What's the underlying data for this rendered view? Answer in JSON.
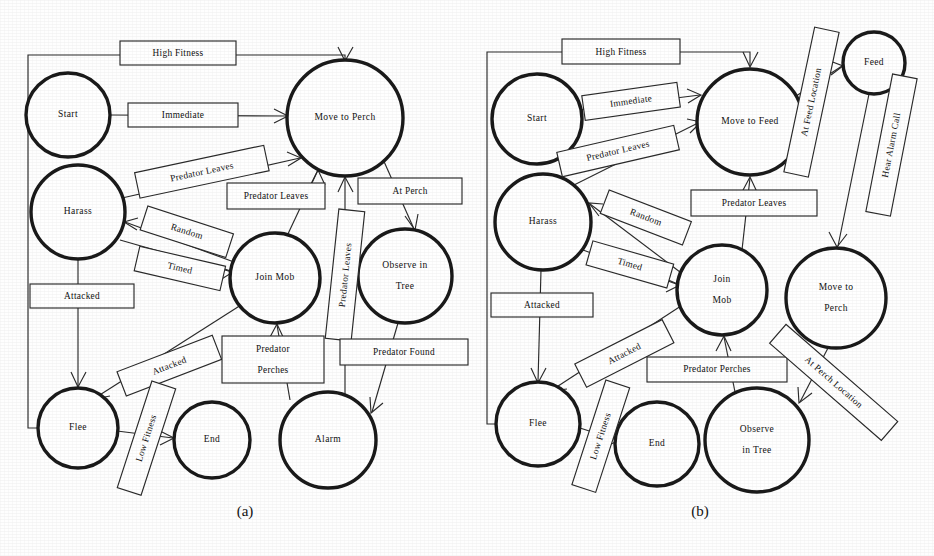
{
  "figure": {
    "panels": [
      {
        "id": "a",
        "caption": "(a)",
        "caption_x": 245,
        "caption_y": 516,
        "states": [
          {
            "name": "start",
            "label": "Start",
            "lines": [
              "Start"
            ],
            "cx": 68,
            "cy": 115,
            "r": 42
          },
          {
            "name": "harass",
            "label": "Harass",
            "lines": [
              "Harass"
            ],
            "cx": 78,
            "cy": 212,
            "r": 47
          },
          {
            "name": "move-to-perch",
            "label": "Move to Perch",
            "lines": [
              "Move to Perch"
            ],
            "cx": 345,
            "cy": 118,
            "r": 58
          },
          {
            "name": "join-mob",
            "label": "Join Mob",
            "lines": [
              "Join Mob"
            ],
            "cx": 275,
            "cy": 278,
            "r": 45
          },
          {
            "name": "observe-in-tree",
            "label": "Observe in Tree",
            "lines": [
              "Observe in",
              "Tree"
            ],
            "cx": 405,
            "cy": 276,
            "r": 47
          },
          {
            "name": "flee",
            "label": "Flee",
            "lines": [
              "Flee"
            ],
            "cx": 78,
            "cy": 428,
            "r": 40
          },
          {
            "name": "end",
            "label": "End",
            "lines": [
              "End"
            ],
            "cx": 212,
            "cy": 440,
            "r": 38
          },
          {
            "name": "alarm",
            "label": "Alarm",
            "lines": [
              "Alarm"
            ],
            "cx": 328,
            "cy": 440,
            "r": 48
          }
        ],
        "transitions": [
          {
            "name": "high-fitness",
            "label": "High Fitness",
            "from": "flee",
            "to": "move-to-perch"
          },
          {
            "name": "immediate",
            "label": "Immediate",
            "from": "start",
            "to": "move-to-perch"
          },
          {
            "name": "predator-leaves-1",
            "label": "Predator Leaves",
            "from": "harass",
            "to": "move-to-perch"
          },
          {
            "name": "predator-leaves-2",
            "label": "Predator Leaves",
            "from": "join-mob",
            "to": "move-to-perch"
          },
          {
            "name": "predator-leaves-3",
            "label": "Predator Leaves",
            "from": "alarm",
            "to": "move-to-perch"
          },
          {
            "name": "at-perch",
            "label": "At Perch",
            "from": "move-to-perch",
            "to": "observe-in-tree"
          },
          {
            "name": "random",
            "label": "Random",
            "from": "join-mob",
            "to": "harass"
          },
          {
            "name": "timed",
            "label": "Timed",
            "from": "harass",
            "to": "join-mob"
          },
          {
            "name": "attacked-1",
            "label": "Attacked",
            "from": "harass",
            "to": "flee"
          },
          {
            "name": "attacked-2",
            "label": "Attacked",
            "from": "join-mob",
            "to": "flee"
          },
          {
            "name": "low-fitness",
            "label": "Low Fitness",
            "from": "flee",
            "to": "end"
          },
          {
            "name": "predator-perches",
            "label": "Predator Perches",
            "from": "alarm",
            "to": "join-mob"
          },
          {
            "name": "predator-found",
            "label": "Predator Found",
            "from": "observe-in-tree",
            "to": "alarm"
          }
        ]
      },
      {
        "id": "b",
        "caption": "(b)",
        "caption_x": 700,
        "caption_y": 516,
        "states": [
          {
            "name": "start",
            "label": "Start",
            "lines": [
              "Start"
            ],
            "cx": 537,
            "cy": 119,
            "r": 45
          },
          {
            "name": "harass",
            "label": "Harass",
            "lines": [
              "Harass"
            ],
            "cx": 543,
            "cy": 222,
            "r": 48
          },
          {
            "name": "move-to-feed",
            "label": "Move to Feed",
            "lines": [
              "Move to Feed"
            ],
            "cx": 750,
            "cy": 122,
            "r": 53
          },
          {
            "name": "feed",
            "label": "Feed",
            "lines": [
              "Feed"
            ],
            "cx": 874,
            "cy": 63,
            "r": 31
          },
          {
            "name": "join-mob",
            "label": "Join Mob",
            "lines": [
              "Join",
              "Mob"
            ],
            "cx": 722,
            "cy": 290,
            "r": 45
          },
          {
            "name": "move-to-perch",
            "label": "Move to Perch",
            "lines": [
              "Move to",
              "Perch"
            ],
            "cx": 836,
            "cy": 298,
            "r": 50
          },
          {
            "name": "flee",
            "label": "Flee",
            "lines": [
              "Flee"
            ],
            "cx": 538,
            "cy": 424,
            "r": 42
          },
          {
            "name": "end",
            "label": "End",
            "lines": [
              "End"
            ],
            "cx": 657,
            "cy": 444,
            "r": 42
          },
          {
            "name": "observe-in-tree",
            "label": "Observe in Tree",
            "lines": [
              "Observe",
              "in Tree"
            ],
            "cx": 757,
            "cy": 440,
            "r": 52
          }
        ],
        "transitions": [
          {
            "name": "high-fitness",
            "label": "High Fitness",
            "from": "flee",
            "to": "move-to-feed"
          },
          {
            "name": "immediate",
            "label": "Immediate",
            "from": "start",
            "to": "move-to-feed"
          },
          {
            "name": "predator-leaves-1",
            "label": "Predator Leaves",
            "from": "harass",
            "to": "move-to-feed"
          },
          {
            "name": "predator-leaves-2",
            "label": "Predator Leaves",
            "from": "join-mob",
            "to": "move-to-feed"
          },
          {
            "name": "at-feed-location",
            "label": "At Feed Location",
            "from": "move-to-feed",
            "to": "feed"
          },
          {
            "name": "hear-alarm-call",
            "label": "Hear Alarm Call",
            "from": "feed",
            "to": "move-to-perch"
          },
          {
            "name": "random",
            "label": "Random",
            "from": "join-mob",
            "to": "harass"
          },
          {
            "name": "timed",
            "label": "Timed",
            "from": "harass",
            "to": "join-mob"
          },
          {
            "name": "attacked-1",
            "label": "Attacked",
            "from": "harass",
            "to": "flee"
          },
          {
            "name": "attacked-2",
            "label": "Attacked",
            "from": "join-mob",
            "to": "flee"
          },
          {
            "name": "low-fitness",
            "label": "Low Fitness",
            "from": "flee",
            "to": "end"
          },
          {
            "name": "predator-perches",
            "label": "Predator Perches",
            "from": "observe-in-tree",
            "to": "join-mob"
          },
          {
            "name": "at-perch-location",
            "label": "At Perch Location",
            "from": "move-to-perch",
            "to": "observe-in-tree"
          }
        ]
      }
    ],
    "colors": {
      "ink": "#1a1a1a",
      "line": "#2a2a2a",
      "paper": "#fefefe"
    }
  }
}
